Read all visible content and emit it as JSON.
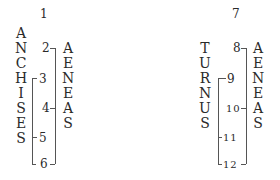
{
  "diagrams": [
    {
      "id": "left",
      "top_number": "1",
      "left_name": [
        "A",
        "N",
        "C",
        "H",
        "I",
        "S",
        "E",
        "S"
      ],
      "right_name": [
        "A",
        "E",
        "N",
        "E",
        "A",
        "S"
      ],
      "numbers": [
        "2",
        "3",
        "4",
        "5",
        "6"
      ]
    },
    {
      "id": "right",
      "top_number": "7",
      "left_name": [
        "T",
        "U",
        "R",
        "N",
        "U",
        "S"
      ],
      "right_name": [
        "A",
        "E",
        "N",
        "E",
        "A",
        "S"
      ],
      "numbers": [
        "8",
        "9",
        "10",
        "11",
        "12"
      ]
    }
  ],
  "colors": {
    "ink": "#2a2a2a",
    "line": "#555555",
    "background": "#ffffff"
  }
}
